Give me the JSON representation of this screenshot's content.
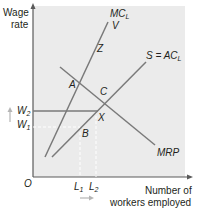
{
  "diagram": {
    "y_axis_label_line1": "Wage",
    "y_axis_label_line2": "rate",
    "x_axis_label_line1": "Number of",
    "x_axis_label_line2": "workers employed",
    "origin": "O",
    "curves": {
      "mcl": "MC",
      "mcl_sub": "L",
      "v": "V",
      "supply": "S = AC",
      "supply_sub": "L",
      "mrp": "MRP"
    },
    "points": {
      "z": "Z",
      "a": "A",
      "c": "C",
      "x": "X",
      "b": "B"
    },
    "wages": {
      "w2": "W",
      "w2_sub": "2",
      "w1": "W",
      "w1_sub": "1"
    },
    "labour": {
      "l1": "L",
      "l1_sub": "1",
      "l2": "L",
      "l2_sub": "2"
    },
    "colors": {
      "plot_bg": "#ebebeb",
      "line": "#7a7a7a",
      "axis": "#5a5a5a",
      "arrow": "#b5b5b5",
      "text": "#231f20"
    }
  }
}
